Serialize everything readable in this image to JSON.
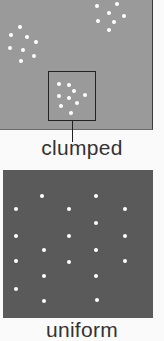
{
  "panels": [
    {
      "id": "clumped",
      "label": "clumped",
      "background": "#9a9a9a",
      "dots": [
        [
          97,
          6
        ],
        [
          117,
          4
        ],
        [
          109,
          13
        ],
        [
          124,
          16
        ],
        [
          98,
          21
        ],
        [
          114,
          22
        ],
        [
          109,
          30
        ],
        [
          20,
          27
        ],
        [
          11,
          35
        ],
        [
          27,
          37
        ],
        [
          36,
          42
        ],
        [
          10,
          48
        ],
        [
          23,
          50
        ],
        [
          34,
          56
        ],
        [
          21,
          61
        ],
        [
          59,
          84
        ],
        [
          69,
          85
        ],
        [
          74,
          91
        ],
        [
          59,
          96
        ],
        [
          69,
          98
        ],
        [
          85,
          95
        ],
        [
          61,
          106
        ],
        [
          77,
          103
        ],
        [
          71,
          113
        ]
      ],
      "highlight_box": {
        "x": 48,
        "y": 71,
        "w": 48,
        "h": 50
      }
    },
    {
      "id": "uniform",
      "label": "uniform",
      "background": "#5a5a5a",
      "dots": [
        [
          42,
          196
        ],
        [
          96,
          196
        ],
        [
          16,
          209
        ],
        [
          69,
          209
        ],
        [
          125,
          209
        ],
        [
          96,
          223
        ],
        [
          16,
          236
        ],
        [
          69,
          236
        ],
        [
          125,
          236
        ],
        [
          44,
          250
        ],
        [
          96,
          250
        ],
        [
          16,
          261
        ],
        [
          69,
          262
        ],
        [
          125,
          261
        ],
        [
          44,
          276
        ],
        [
          96,
          276
        ],
        [
          16,
          289
        ],
        [
          44,
          301
        ],
        [
          97,
          300
        ]
      ]
    }
  ]
}
